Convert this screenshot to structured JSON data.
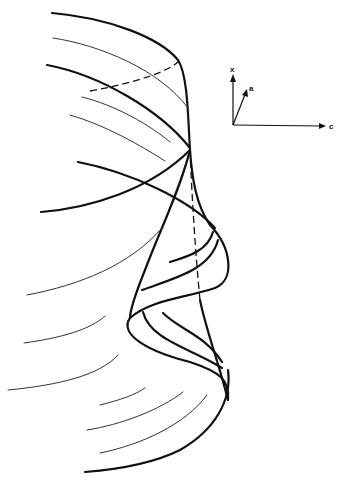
{
  "figure": {
    "type": "3d-surface-line-drawing",
    "background": "#ffffff",
    "stroke_color": "#111111"
  },
  "axes": {
    "labels": {
      "vertical": "x",
      "oblique": "a",
      "horizontal": "c"
    }
  }
}
